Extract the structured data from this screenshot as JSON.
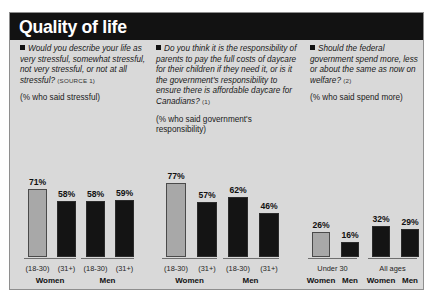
{
  "header": {
    "title": "Quality of life"
  },
  "questions": [
    {
      "bullet_icon": "square-bullet",
      "text": "Would you describe your life as very stressful, somewhat stressful, not very stressful, or not at all stressful?",
      "source": "(SOURCE 1)",
      "subtitle": "(% who said stressful)"
    },
    {
      "bullet_icon": "square-bullet",
      "text": "Do you think it is the responsibility of parents to pay the full costs of daycare for their children if they need it, or is it the government's responsibility to ensure there is affordable daycare for Canadians?",
      "source": "(1)",
      "subtitle": "(% who said government's responsibility)"
    },
    {
      "bullet_icon": "square-bullet",
      "text": "Should the federal government spend more, less or about the same as now on welfare?",
      "source": "(2)",
      "subtitle": "(% who said spend more)"
    }
  ],
  "colors": {
    "panel_background": "#d9d9d9",
    "header_background": "#121212",
    "header_text": "#ffffff",
    "bar_dark": "#141414",
    "bar_light": "#a8a8a8",
    "axis": "#6f6f6f"
  },
  "chart_data": [
    {
      "type": "bar",
      "title": "Would you describe your life as very stressful, somewhat stressful, not very stressful, or not at all stressful?",
      "ylabel": "(% who said stressful)",
      "xlabel": "",
      "ylim": [
        0,
        100
      ],
      "grid": false,
      "categories": [
        "(18-30)",
        "(31+)",
        "(18-30)",
        "(31+)"
      ],
      "group_labels": [
        "Women",
        "Men"
      ],
      "values": [
        71,
        58,
        58,
        59
      ],
      "value_labels": [
        "71%",
        "58%",
        "58%",
        "59%"
      ],
      "highlight_index": 0
    },
    {
      "type": "bar",
      "title": "Do you think it is the responsibility of parents to pay the full costs of daycare for their children if they need it, or is it the government's responsibility to ensure there is affordable daycare for Canadians?",
      "ylabel": "(% who said government's responsibility)",
      "xlabel": "",
      "ylim": [
        0,
        100
      ],
      "grid": false,
      "categories": [
        "(18-30)",
        "(31+)",
        "(18-30)",
        "(31+)"
      ],
      "group_labels": [
        "Women",
        "Men"
      ],
      "values": [
        77,
        57,
        62,
        46
      ],
      "value_labels": [
        "77%",
        "57%",
        "62%",
        "46%"
      ],
      "highlight_index": 0
    },
    {
      "type": "bar",
      "title": "Should the federal government spend more, less or about the same as now on welfare?",
      "ylabel": "(% who said spend more)",
      "xlabel": "",
      "ylim": [
        0,
        100
      ],
      "grid": false,
      "categories": [
        "Women",
        "Men",
        "Women",
        "Men"
      ],
      "group_labels": [
        "Under 30",
        "All ages"
      ],
      "values": [
        26,
        16,
        32,
        29
      ],
      "value_labels": [
        "26%",
        "16%",
        "32%",
        "29%"
      ],
      "highlight_index": 0
    }
  ]
}
